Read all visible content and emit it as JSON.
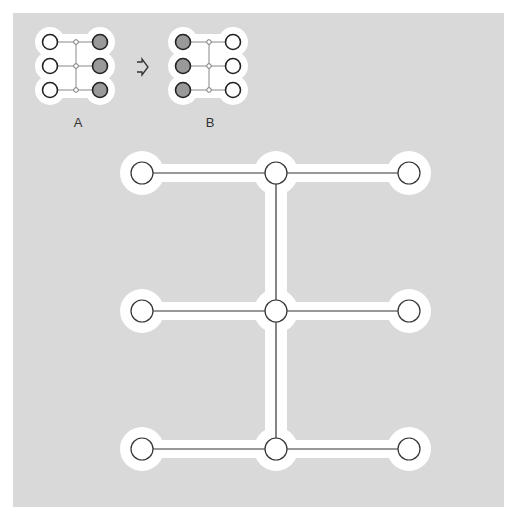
{
  "figure": {
    "background_color": "#d9d9d9",
    "halo_color": "#ffffff",
    "line_color": "#333333",
    "filled_node_color": "#999999"
  },
  "small_diagrams": [
    {
      "label": "A",
      "rows": 3,
      "left_column": "empty",
      "right_column": "filled"
    },
    {
      "label": "B",
      "rows": 3,
      "left_column": "filled",
      "right_column": "empty"
    }
  ],
  "arrow": {
    "icon": "outlined-right-arrow",
    "from": "A",
    "to": "B"
  },
  "main_diagram": {
    "rows": 3,
    "columns": 3,
    "structure": "three horizontal chains of three nodes joined by a vertical spine through the middle column"
  }
}
